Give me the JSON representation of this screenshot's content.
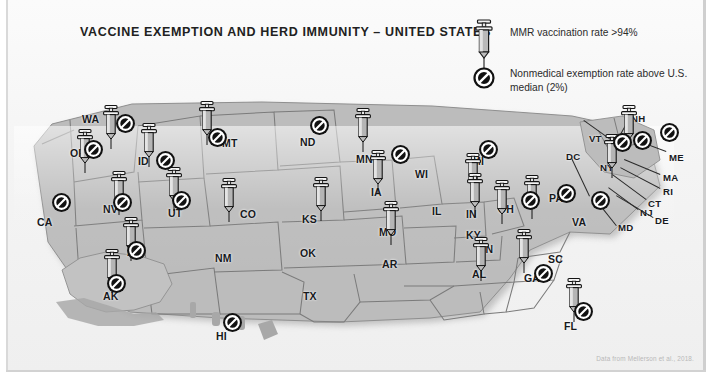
{
  "figure": {
    "title": "VACCINE EXEMPTION AND HERD IMMUNITY – UNITED STATES",
    "credit": "Data from Mellerson et al., 2018.",
    "background_color": "#f4f4f4",
    "ink_color": "#17191c",
    "marker_fill": "#111111"
  },
  "legend": {
    "items": [
      {
        "icon": "syringe-icon",
        "label": "MMR vaccination rate >94%"
      },
      {
        "icon": "no-entry-icon",
        "label": "Nonmedical exemption rate above U.S. median (2%)"
      }
    ]
  },
  "map": {
    "type": "choropleth-pictogram",
    "region": "United States",
    "state_labels": [
      {
        "abbr": "WA",
        "x": 82,
        "y": 113
      },
      {
        "abbr": "OR",
        "x": 70,
        "y": 147
      },
      {
        "abbr": "ID",
        "x": 138,
        "y": 155
      },
      {
        "abbr": "MT",
        "x": 222,
        "y": 137
      },
      {
        "abbr": "ND",
        "x": 300,
        "y": 136
      },
      {
        "abbr": "MN",
        "x": 356,
        "y": 153
      },
      {
        "abbr": "WI",
        "x": 415,
        "y": 168
      },
      {
        "abbr": "MI",
        "x": 472,
        "y": 155
      },
      {
        "abbr": "CA",
        "x": 37,
        "y": 216
      },
      {
        "abbr": "NV",
        "x": 103,
        "y": 203
      },
      {
        "abbr": "UT",
        "x": 168,
        "y": 207
      },
      {
        "abbr": "CO",
        "x": 240,
        "y": 208
      },
      {
        "abbr": "KS",
        "x": 302,
        "y": 213
      },
      {
        "abbr": "IA",
        "x": 371,
        "y": 186
      },
      {
        "abbr": "IL",
        "x": 432,
        "y": 205
      },
      {
        "abbr": "IN",
        "x": 466,
        "y": 208
      },
      {
        "abbr": "OH",
        "x": 498,
        "y": 203
      },
      {
        "abbr": "PA",
        "x": 549,
        "y": 192
      },
      {
        "abbr": "AR",
        "x": 127,
        "y": 246
      },
      {
        "abbr": "NM",
        "x": 215,
        "y": 252
      },
      {
        "abbr": "OK",
        "x": 300,
        "y": 247
      },
      {
        "abbr": "MO",
        "x": 379,
        "y": 226
      },
      {
        "abbr": "KY",
        "x": 466,
        "y": 229
      },
      {
        "abbr": "TN",
        "x": 479,
        "y": 243
      },
      {
        "abbr": "AR",
        "x": 382,
        "y": 258
      },
      {
        "abbr": "TX",
        "x": 303,
        "y": 290
      },
      {
        "abbr": "AL",
        "x": 472,
        "y": 268
      },
      {
        "abbr": "GA",
        "x": 524,
        "y": 272
      },
      {
        "abbr": "SC",
        "x": 548,
        "y": 253
      },
      {
        "abbr": "FL",
        "x": 564,
        "y": 320
      },
      {
        "abbr": "VA",
        "x": 572,
        "y": 216
      },
      {
        "abbr": "AK",
        "x": 103,
        "y": 290
      },
      {
        "abbr": "HI",
        "x": 216,
        "y": 330
      }
    ],
    "callout_labels": [
      {
        "abbr": "VT",
        "x": 589,
        "y": 133
      },
      {
        "abbr": "NH",
        "x": 631,
        "y": 113
      },
      {
        "abbr": "ME",
        "x": 669,
        "y": 152
      },
      {
        "abbr": "MA",
        "x": 663,
        "y": 172
      },
      {
        "abbr": "RI",
        "x": 663,
        "y": 186
      },
      {
        "abbr": "CT",
        "x": 648,
        "y": 198
      },
      {
        "abbr": "NY",
        "x": 600,
        "y": 162
      },
      {
        "abbr": "NJ",
        "x": 640,
        "y": 207
      },
      {
        "abbr": "DE",
        "x": 655,
        "y": 215
      },
      {
        "abbr": "MD",
        "x": 618,
        "y": 222
      },
      {
        "abbr": "DC",
        "x": 566,
        "y": 151
      }
    ],
    "syringe_markers": [
      {
        "state": "WA",
        "x": 100,
        "y": 104
      },
      {
        "state": "OR",
        "x": 74,
        "y": 128
      },
      {
        "state": "ID",
        "x": 138,
        "y": 122
      },
      {
        "state": "MT",
        "x": 196,
        "y": 100
      },
      {
        "state": "NV",
        "x": 108,
        "y": 170
      },
      {
        "state": "UT",
        "x": 163,
        "y": 166
      },
      {
        "state": "CO",
        "x": 218,
        "y": 177
      },
      {
        "state": "KS",
        "x": 310,
        "y": 176
      },
      {
        "state": "MN",
        "x": 352,
        "y": 107
      },
      {
        "state": "IA",
        "x": 367,
        "y": 149
      },
      {
        "state": "MI",
        "x": 462,
        "y": 152
      },
      {
        "state": "IN",
        "x": 464,
        "y": 172
      },
      {
        "state": "OH",
        "x": 491,
        "y": 179
      },
      {
        "state": "MO",
        "x": 380,
        "y": 200
      },
      {
        "state": "AZ",
        "x": 120,
        "y": 216
      },
      {
        "state": "AK",
        "x": 101,
        "y": 248
      },
      {
        "state": "AL",
        "x": 470,
        "y": 236
      },
      {
        "state": "GA",
        "x": 513,
        "y": 228
      },
      {
        "state": "FL",
        "x": 563,
        "y": 277
      },
      {
        "state": "NY",
        "x": 601,
        "y": 133
      },
      {
        "state": "NH",
        "x": 618,
        "y": 104
      },
      {
        "state": "VA",
        "x": 521,
        "y": 174
      }
    ],
    "no_entry_markers": [
      {
        "state": "WA",
        "x": 115,
        "y": 113
      },
      {
        "state": "OR",
        "x": 83,
        "y": 139
      },
      {
        "state": "ID",
        "x": 155,
        "y": 150
      },
      {
        "state": "MT",
        "x": 207,
        "y": 127
      },
      {
        "state": "ND",
        "x": 309,
        "y": 115
      },
      {
        "state": "CA",
        "x": 51,
        "y": 192
      },
      {
        "state": "NV",
        "x": 112,
        "y": 192
      },
      {
        "state": "UT",
        "x": 171,
        "y": 190
      },
      {
        "state": "AZ",
        "x": 126,
        "y": 240
      },
      {
        "state": "AK",
        "x": 106,
        "y": 273
      },
      {
        "state": "HI",
        "x": 222,
        "y": 312
      },
      {
        "state": "WI",
        "x": 390,
        "y": 144
      },
      {
        "state": "MI",
        "x": 478,
        "y": 139
      },
      {
        "state": "OH",
        "x": 520,
        "y": 190
      },
      {
        "state": "PA",
        "x": 556,
        "y": 183
      },
      {
        "state": "VT",
        "x": 612,
        "y": 132
      },
      {
        "state": "NH",
        "x": 632,
        "y": 130
      },
      {
        "state": "ME",
        "x": 659,
        "y": 122
      },
      {
        "state": "NY",
        "x": 590,
        "y": 190
      },
      {
        "state": "GA",
        "x": 533,
        "y": 263
      },
      {
        "state": "FL",
        "x": 573,
        "y": 301
      }
    ]
  }
}
